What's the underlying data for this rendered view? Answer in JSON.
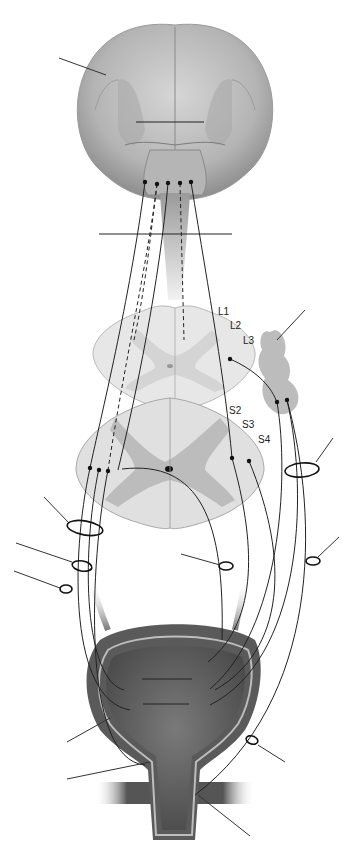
{
  "diagram": {
    "spinal_segment_labels_lumbar": [
      "L1",
      "L2",
      "L3"
    ],
    "spinal_segment_labels_sacral": [
      "S2",
      "S3",
      "S4"
    ],
    "structures": [
      "brain",
      "brainstem-pons",
      "spinal-cord-lumbar-section",
      "spinal-cord-sacral-section",
      "sympathetic-ganglion-chain",
      "urinary-bladder",
      "urethra",
      "external-sphincter-muscle"
    ],
    "leader_lines_count": 14,
    "colors": {
      "brain": "#b8b8b8",
      "cord_white_matter": "#e2e2e2",
      "cord_gray_matter": "#b5b5b5",
      "ganglion": "#bcbcbc",
      "bladder_wall": "#5a5a5a",
      "bladder_lumen": "#6d6d6d",
      "nerve_line": "#222222"
    }
  }
}
